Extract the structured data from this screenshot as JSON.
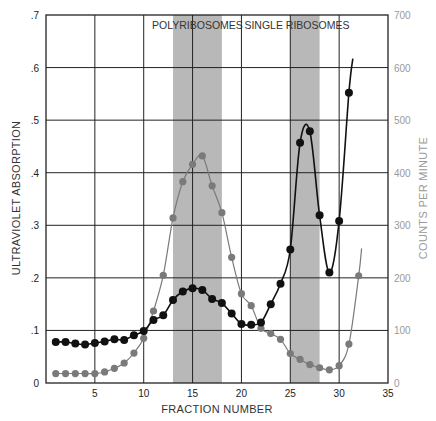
{
  "chart_data": {
    "type": "line",
    "title": "",
    "xlabel": "FRACTION NUMBER",
    "ylabel": "ULTRAVIOLET ABSORPTION",
    "y2label": "COUNTS PER MINUTE",
    "xlim": [
      0,
      35
    ],
    "ylim": [
      0,
      0.7
    ],
    "y2lim": [
      0,
      700
    ],
    "x_ticks": [
      5,
      10,
      15,
      20,
      25,
      30,
      35
    ],
    "y_ticks": [
      0,
      0.1,
      0.2,
      0.3,
      0.4,
      0.5,
      0.6,
      0.7
    ],
    "y_tick_labels": [
      "0",
      ".1",
      ".2",
      ".3",
      ".4",
      ".5",
      ".6",
      ".7"
    ],
    "y2_ticks": [
      0,
      100,
      200,
      300,
      400,
      500,
      600,
      700
    ],
    "grid": true,
    "shaded_regions": [
      {
        "label": "POLYRIBOSOMES",
        "x_start": 13,
        "x_end": 18
      },
      {
        "label": "SINGLE RIBOSOMES",
        "x_start": 25,
        "x_end": 28
      }
    ],
    "series": [
      {
        "name": "Ultraviolet absorption",
        "axis": "left",
        "color": "#111111",
        "x": [
          1,
          2,
          3,
          4,
          5,
          6,
          7,
          8,
          9,
          10,
          11,
          12,
          13,
          14,
          15,
          16,
          17,
          18,
          19,
          20,
          21,
          22,
          23,
          24,
          25,
          26,
          27,
          28,
          29,
          30,
          31
        ],
        "values": [
          0.078,
          0.078,
          0.075,
          0.073,
          0.076,
          0.079,
          0.083,
          0.082,
          0.091,
          0.099,
          0.12,
          0.129,
          0.158,
          0.174,
          0.18,
          0.177,
          0.16,
          0.152,
          0.132,
          0.112,
          0.111,
          0.115,
          0.15,
          0.189,
          0.254,
          0.457,
          0.479,
          0.319,
          0.21,
          0.308,
          0.552
        ],
        "line_extends_to": [
          31.4,
          0.617
        ]
      },
      {
        "name": "Counts per minute",
        "axis": "right",
        "color": "#7a7a7a",
        "x": [
          1,
          2,
          3,
          4,
          5,
          6,
          7,
          8,
          9,
          10,
          11,
          12,
          13,
          14,
          15,
          16,
          17,
          18,
          19,
          20,
          21,
          22,
          23,
          24,
          25,
          26,
          27,
          28,
          29,
          30,
          31,
          32
        ],
        "values": [
          18,
          18,
          18,
          18,
          18,
          21,
          28,
          38,
          57,
          85,
          137,
          205,
          314,
          383,
          416,
          432,
          375,
          324,
          239,
          170,
          147,
          104,
          94,
          83,
          56,
          45,
          35,
          29,
          25,
          33,
          74,
          204
        ],
        "line_extends_to": [
          32.3,
          256
        ]
      }
    ]
  }
}
